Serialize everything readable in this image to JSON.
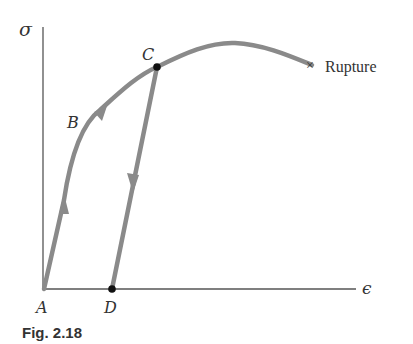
{
  "figure": {
    "caption": "Fig. 2.18",
    "axes": {
      "y_label": "σ",
      "x_label": "ϵ"
    },
    "points": [
      {
        "id": "A",
        "label": "A"
      },
      {
        "id": "B",
        "label": "B"
      },
      {
        "id": "C",
        "label": "C"
      },
      {
        "id": "D",
        "label": "D"
      }
    ],
    "rupture_label": "Rupture",
    "rupture_marker": "×",
    "colors": {
      "curve": "#8a8a8a",
      "axis": "#555555",
      "point": "#111111"
    }
  }
}
